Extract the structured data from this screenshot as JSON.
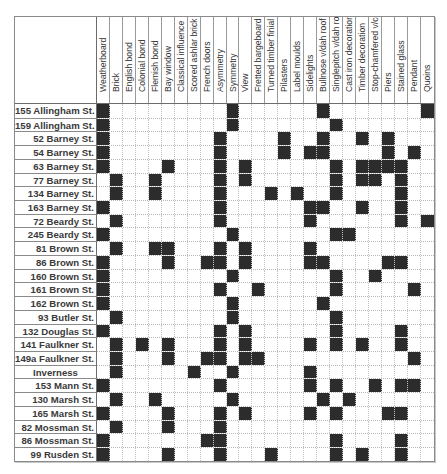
{
  "columns": [
    "Weatherboard",
    "Brick",
    "English bond",
    "Colonial bond",
    "Flemish bond",
    "Bay window",
    "Classical influence",
    "Scored ashlar brick",
    "French doors",
    "Asymmetry",
    "Symmetry",
    "View",
    "Fretted bargeboard",
    "Turned timber finial",
    "Pilasters",
    "Label moulds",
    "Sidelights",
    "Bullnose v/dah roof",
    "Singlepitch v/dah roof",
    "Cast iron decoration",
    "Timber decoration",
    "Stop-chamfered v/col",
    "Piers",
    "Stained glass",
    "Pendant",
    "Quoins"
  ],
  "rows": [
    {
      "label": "155 Allingham St.",
      "features": [
        1,
        11,
        18,
        26
      ]
    },
    {
      "label": "159 Allingham St.",
      "features": [
        1,
        11,
        19
      ]
    },
    {
      "label": "52 Barney St.",
      "features": [
        1,
        10,
        15,
        18,
        21,
        23
      ]
    },
    {
      "label": "54 Barney St.",
      "features": [
        1,
        10,
        15,
        17,
        18,
        23,
        25
      ]
    },
    {
      "label": "63 Barney St.",
      "features": [
        1,
        6,
        10,
        12,
        19,
        21,
        22,
        23,
        24
      ]
    },
    {
      "label": "77 Barney St.",
      "features": [
        2,
        5,
        10,
        12,
        19,
        21,
        22,
        24
      ]
    },
    {
      "label": "134 Barney St.",
      "features": [
        2,
        5,
        10,
        14,
        16,
        19,
        24
      ]
    },
    {
      "label": "163 Barney St.",
      "features": [
        1,
        10,
        17,
        18,
        21,
        24
      ]
    },
    {
      "label": "72 Beardy St.",
      "features": [
        2,
        10,
        17,
        24,
        26
      ]
    },
    {
      "label": "245 Beardy St.",
      "features": [
        1,
        11,
        19,
        20
      ]
    },
    {
      "label": "81 Brown St.",
      "features": [
        2,
        5,
        6,
        10,
        12,
        17
      ]
    },
    {
      "label": "86 Brown St.",
      "features": [
        1,
        6,
        9,
        10,
        12,
        17,
        18,
        23,
        24
      ]
    },
    {
      "label": "160 Brown St.",
      "features": [
        1,
        11,
        19,
        22
      ]
    },
    {
      "label": "161 Brown St.",
      "features": [
        1,
        10,
        13,
        19,
        25
      ]
    },
    {
      "label": "162 Brown St.",
      "features": [
        1,
        11,
        18
      ]
    },
    {
      "label": "93 Butler St.",
      "features": [
        2,
        11,
        19
      ]
    },
    {
      "label": "132 Douglas St.",
      "features": [
        1,
        10,
        12,
        19,
        24
      ]
    },
    {
      "label": "141 Faulkner St.",
      "features": [
        2,
        4,
        6,
        10,
        12,
        17,
        19,
        21,
        24
      ]
    },
    {
      "label": "149a Faulkner St.",
      "features": [
        2,
        6,
        9,
        10,
        12,
        13,
        25
      ]
    },
    {
      "label": "Inverness",
      "features": [
        2,
        8,
        11,
        17
      ],
      "centered": true
    },
    {
      "label": "153 Mann St.",
      "features": [
        1,
        10,
        17,
        19,
        22,
        24,
        25
      ]
    },
    {
      "label": "130 Marsh St.",
      "features": [
        2,
        5,
        11,
        18,
        20
      ]
    },
    {
      "label": "165 Marsh St.",
      "features": [
        1,
        6,
        10,
        12,
        17,
        19,
        23,
        24
      ]
    },
    {
      "label": "82 Mossman St.",
      "features": [
        2,
        6,
        10
      ]
    },
    {
      "label": "86 Mossman St.",
      "features": [
        1,
        9,
        10,
        19,
        24
      ]
    },
    {
      "label": "99 Rusden St.",
      "features": [
        1,
        6,
        10,
        14,
        19,
        21,
        24
      ]
    }
  ],
  "colors": {
    "filled": "#2c2c2c",
    "empty": "#ffffff"
  }
}
